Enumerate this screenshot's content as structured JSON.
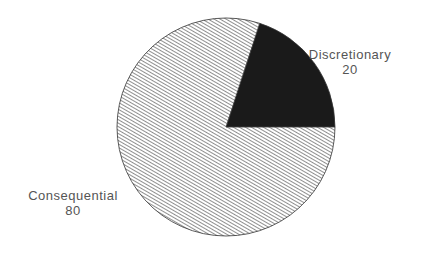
{
  "chart_data": {
    "type": "pie",
    "title": "",
    "slices": [
      {
        "label": "Discretionary",
        "value": 20,
        "fill": "solid",
        "color": "#1a1a1a"
      },
      {
        "label": "Consequential",
        "value": 80,
        "fill": "diagonal-hatch",
        "color": "#555555"
      }
    ],
    "legend": "none",
    "start_angle_deg": 0,
    "direction": "counterclockwise"
  },
  "labels": {
    "discretionary": {
      "name": "Discretionary",
      "value": "20"
    },
    "consequential": {
      "name": "Consequential",
      "value": "80"
    }
  }
}
